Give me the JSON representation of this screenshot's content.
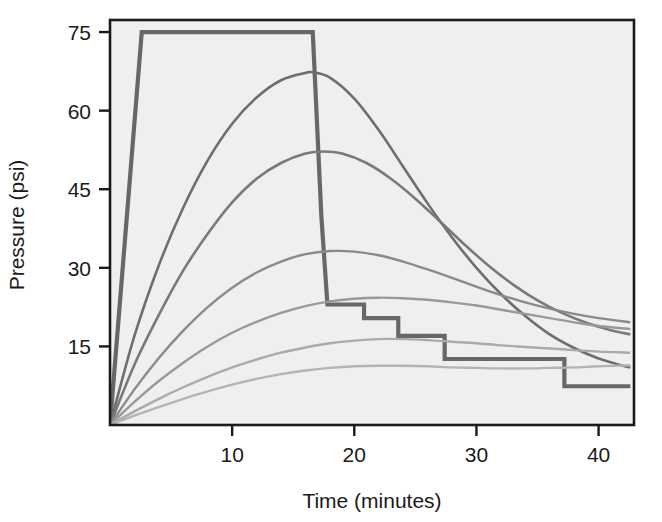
{
  "chart_data": {
    "type": "line",
    "title": "",
    "xlabel": "Time (minutes)",
    "ylabel": "Pressure (psi)",
    "xlim": [
      0,
      42.9
    ],
    "ylim": [
      0,
      77.3
    ],
    "xticks": [
      10,
      20,
      30,
      40
    ],
    "yticks": [
      15,
      30,
      45,
      60,
      75
    ],
    "xticklabels": [
      "10",
      "20",
      "30",
      "40"
    ],
    "yticklabels": [
      "15",
      "30",
      "45",
      "60",
      "75"
    ],
    "grid": false,
    "legend": "none",
    "plot_background": "#efefef",
    "frame_color": "#1a1a1a",
    "series": [
      {
        "name": "square-pulse-profile",
        "style": "step-plateau",
        "color": "#676767",
        "width": 4.2,
        "points": [
          [
            0.0,
            0.0
          ],
          [
            2.6,
            75.0
          ],
          [
            16.6,
            75.0
          ],
          [
            17.3,
            40.0
          ],
          [
            17.8,
            23.0
          ],
          [
            20.8,
            23.0
          ],
          [
            20.8,
            20.4
          ],
          [
            23.6,
            20.4
          ],
          [
            23.6,
            17.0
          ],
          [
            27.4,
            17.0
          ],
          [
            27.4,
            12.6
          ],
          [
            37.2,
            12.6
          ],
          [
            37.2,
            7.4
          ],
          [
            42.6,
            7.4
          ]
        ]
      },
      {
        "name": "curve-peak-67",
        "color": "#6e6e6e",
        "width": 2.6,
        "points": [
          [
            0.0,
            0.0
          ],
          [
            2.0,
            17.0
          ],
          [
            4.0,
            30.5
          ],
          [
            6.0,
            41.5
          ],
          [
            8.0,
            50.5
          ],
          [
            10.0,
            57.5
          ],
          [
            12.0,
            62.5
          ],
          [
            14.0,
            65.8
          ],
          [
            16.0,
            67.2
          ],
          [
            16.6,
            67.3
          ],
          [
            18.0,
            66.3
          ],
          [
            20.0,
            62.3
          ],
          [
            22.0,
            56.3
          ],
          [
            24.0,
            49.3
          ],
          [
            26.0,
            42.3
          ],
          [
            28.0,
            35.8
          ],
          [
            30.0,
            30.0
          ],
          [
            32.0,
            25.0
          ],
          [
            34.0,
            20.8
          ],
          [
            36.0,
            17.3
          ],
          [
            38.0,
            14.7
          ],
          [
            40.0,
            12.7
          ],
          [
            42.0,
            11.3
          ],
          [
            42.6,
            11.0
          ]
        ]
      },
      {
        "name": "curve-peak-52",
        "color": "#797979",
        "width": 2.6,
        "points": [
          [
            0.0,
            0.0
          ],
          [
            2.0,
            11.5
          ],
          [
            4.0,
            21.0
          ],
          [
            6.0,
            29.5
          ],
          [
            8.0,
            36.5
          ],
          [
            10.0,
            42.5
          ],
          [
            12.0,
            47.0
          ],
          [
            14.0,
            50.0
          ],
          [
            16.0,
            51.8
          ],
          [
            17.5,
            52.2
          ],
          [
            19.0,
            51.8
          ],
          [
            21.0,
            50.0
          ],
          [
            23.0,
            47.0
          ],
          [
            25.0,
            43.2
          ],
          [
            27.0,
            38.9
          ],
          [
            29.0,
            34.5
          ],
          [
            31.0,
            30.4
          ],
          [
            33.0,
            26.8
          ],
          [
            35.0,
            23.8
          ],
          [
            37.0,
            21.4
          ],
          [
            39.0,
            19.5
          ],
          [
            41.0,
            18.1
          ],
          [
            42.6,
            17.3
          ]
        ]
      },
      {
        "name": "curve-peak-33",
        "color": "#8a8a8a",
        "width": 2.4,
        "points": [
          [
            0.0,
            0.0
          ],
          [
            2.0,
            6.8
          ],
          [
            4.0,
            12.8
          ],
          [
            6.0,
            18.0
          ],
          [
            8.0,
            22.5
          ],
          [
            10.0,
            26.2
          ],
          [
            12.0,
            29.1
          ],
          [
            14.0,
            31.2
          ],
          [
            16.0,
            32.6
          ],
          [
            18.0,
            33.2
          ],
          [
            20.0,
            33.1
          ],
          [
            22.0,
            32.4
          ],
          [
            24.0,
            31.2
          ],
          [
            26.0,
            29.7
          ],
          [
            28.0,
            28.1
          ],
          [
            30.0,
            26.4
          ],
          [
            32.0,
            24.8
          ],
          [
            34.0,
            23.4
          ],
          [
            36.0,
            22.2
          ],
          [
            38.0,
            21.2
          ],
          [
            40.0,
            20.4
          ],
          [
            42.6,
            19.6
          ]
        ]
      },
      {
        "name": "curve-peak-24",
        "color": "#999999",
        "width": 2.4,
        "points": [
          [
            0.0,
            0.0
          ],
          [
            2.0,
            4.4
          ],
          [
            4.0,
            8.4
          ],
          [
            6.0,
            11.9
          ],
          [
            8.0,
            15.0
          ],
          [
            10.0,
            17.6
          ],
          [
            12.0,
            19.7
          ],
          [
            14.0,
            21.4
          ],
          [
            16.0,
            22.7
          ],
          [
            18.0,
            23.6
          ],
          [
            20.0,
            24.1
          ],
          [
            22.0,
            24.3
          ],
          [
            24.0,
            24.2
          ],
          [
            26.0,
            23.9
          ],
          [
            28.0,
            23.4
          ],
          [
            30.0,
            22.8
          ],
          [
            32.0,
            22.0
          ],
          [
            34.0,
            21.2
          ],
          [
            36.0,
            20.4
          ],
          [
            38.0,
            19.6
          ],
          [
            40.0,
            18.9
          ],
          [
            42.6,
            18.3
          ]
        ]
      },
      {
        "name": "curve-peak-16",
        "color": "#aaaaaa",
        "width": 2.4,
        "points": [
          [
            0.0,
            0.0
          ],
          [
            2.0,
            2.6
          ],
          [
            4.0,
            5.0
          ],
          [
            6.0,
            7.2
          ],
          [
            8.0,
            9.2
          ],
          [
            10.0,
            11.0
          ],
          [
            12.0,
            12.5
          ],
          [
            14.0,
            13.8
          ],
          [
            16.0,
            14.8
          ],
          [
            18.0,
            15.6
          ],
          [
            20.0,
            16.1
          ],
          [
            22.0,
            16.4
          ],
          [
            24.0,
            16.4
          ],
          [
            26.0,
            16.2
          ],
          [
            28.0,
            15.9
          ],
          [
            30.0,
            15.6
          ],
          [
            32.0,
            15.2
          ],
          [
            34.0,
            14.9
          ],
          [
            36.0,
            14.6
          ],
          [
            38.0,
            14.3
          ],
          [
            40.0,
            14.0
          ],
          [
            42.6,
            13.8
          ]
        ]
      },
      {
        "name": "curve-peak-12",
        "color": "#b4b4b4",
        "width": 2.4,
        "points": [
          [
            0.0,
            0.0
          ],
          [
            2.0,
            1.8
          ],
          [
            4.0,
            3.4
          ],
          [
            6.0,
            5.0
          ],
          [
            8.0,
            6.4
          ],
          [
            10.0,
            7.7
          ],
          [
            12.0,
            8.8
          ],
          [
            14.0,
            9.7
          ],
          [
            16.0,
            10.4
          ],
          [
            18.0,
            10.9
          ],
          [
            20.0,
            11.2
          ],
          [
            22.0,
            11.3
          ],
          [
            24.0,
            11.3
          ],
          [
            26.0,
            11.2
          ],
          [
            28.0,
            11.0
          ],
          [
            30.0,
            10.9
          ],
          [
            32.0,
            10.8
          ],
          [
            34.0,
            10.8
          ],
          [
            36.0,
            10.9
          ],
          [
            38.0,
            11.0
          ],
          [
            40.0,
            11.2
          ],
          [
            42.6,
            11.4
          ]
        ]
      }
    ]
  },
  "axes": {
    "x_title": "Time (minutes)",
    "y_title": "Pressure (psi)"
  }
}
